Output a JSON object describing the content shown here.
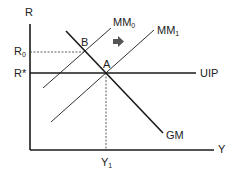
{
  "diagram": {
    "type": "economics-model-diagram",
    "axes": {
      "y_label": "R",
      "x_label": "Y"
    },
    "y_ticks": [
      {
        "label": "R",
        "sub": "0"
      },
      {
        "label": "R*",
        "sub": ""
      }
    ],
    "x_ticks": [
      {
        "label": "Y",
        "sub": "1"
      }
    ],
    "curves": [
      {
        "name": "MM",
        "sub": "0",
        "type": "upward"
      },
      {
        "name": "MM",
        "sub": "1",
        "type": "upward"
      },
      {
        "name": "UIP",
        "sub": "",
        "type": "horizontal"
      },
      {
        "name": "GM",
        "sub": "",
        "type": "downward"
      }
    ],
    "points": [
      {
        "label": "A"
      },
      {
        "label": "B"
      }
    ],
    "shift_arrow": "right",
    "colors": {
      "line": "#1a1a1a",
      "arrow": "#555555"
    }
  }
}
